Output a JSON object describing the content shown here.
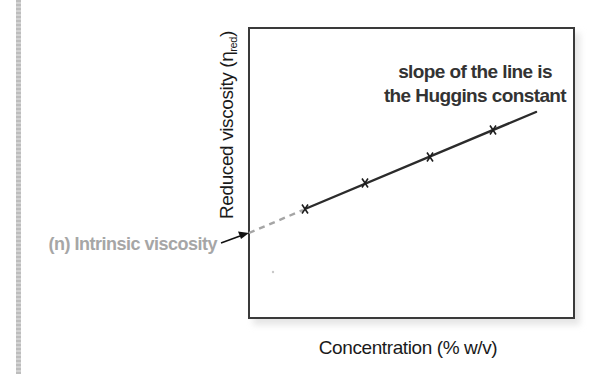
{
  "chart_data": {
    "type": "line",
    "title": "",
    "xlabel": "Concentration (% w/v)",
    "ylabel": "Reduced viscosity (η_red)",
    "ylabel_main": "Reduced viscosity (η",
    "ylabel_sub": "red",
    "ylabel_close": ")",
    "grid": false,
    "legend": null,
    "axis_ticks": false,
    "series": [
      {
        "name": "measured points",
        "marker": "x",
        "points_px": [
          [
            305,
            209
          ],
          [
            365,
            183
          ],
          [
            430,
            157
          ],
          [
            493,
            130
          ]
        ]
      }
    ],
    "fit_line": {
      "style": "solid",
      "from_px": [
        305,
        209
      ],
      "to_px": [
        536,
        112
      ],
      "color": "#2b2b2b"
    },
    "extrapolation": {
      "style": "dashed",
      "from_px": [
        249,
        233
      ],
      "to_px": [
        303,
        210
      ],
      "color": "#a5a5a5"
    },
    "annotations": [
      {
        "id": "slope",
        "lines": [
          "slope of the line is",
          "the Huggins constant"
        ]
      },
      {
        "id": "intercept",
        "text": "(n) Intrinsic viscosity",
        "arrow_to_px": [
          248,
          233
        ],
        "color": "#a6a6a6"
      }
    ],
    "plot_box_px": {
      "x": 249,
      "y": 28,
      "width": 325,
      "height": 290
    }
  }
}
